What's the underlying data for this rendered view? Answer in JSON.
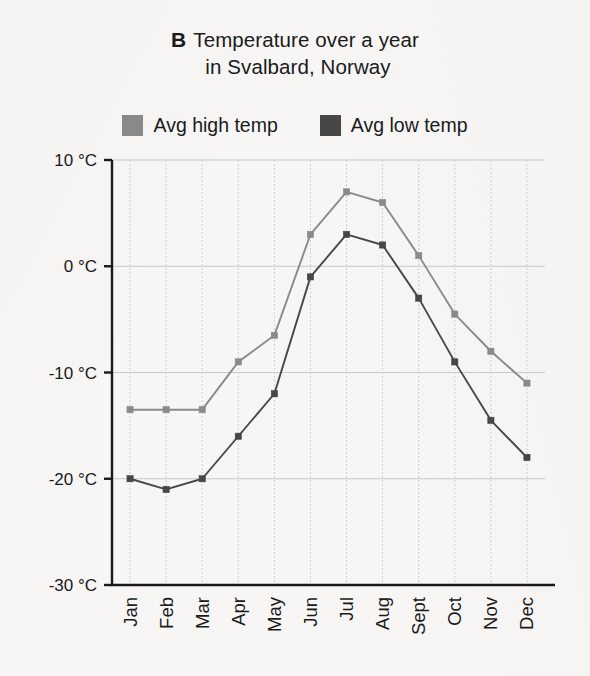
{
  "figure": {
    "panel_letter": "B",
    "title_line_1": "Temperature over a year",
    "title_line_2": "in Svalbard, Norway"
  },
  "legend": {
    "items": [
      {
        "label": "Avg high temp",
        "color": "#8a8a8a",
        "swatch_name": "legend-swatch-avg-high"
      },
      {
        "label": "Avg low temp",
        "color": "#474747",
        "swatch_name": "legend-swatch-avg-low"
      }
    ]
  },
  "axes": {
    "y_tick_labels": [
      "10 °C",
      "0 °C",
      "-10 °C",
      "-20 °C",
      "-30 °C"
    ],
    "y_tick_values": [
      10,
      0,
      -10,
      -20,
      -30
    ],
    "x_tick_labels": [
      "Jan",
      "Feb",
      "Mar",
      "Apr",
      "May",
      "Jun",
      "Jul",
      "Aug",
      "Sept",
      "Oct",
      "Nov",
      "Dec"
    ]
  },
  "chart_data": {
    "type": "line",
    "xlabel": "",
    "ylabel": "",
    "categories": [
      "Jan",
      "Feb",
      "Mar",
      "Apr",
      "May",
      "Jun",
      "Jul",
      "Aug",
      "Sept",
      "Oct",
      "Nov",
      "Dec"
    ],
    "series": [
      {
        "name": "Avg high temp",
        "color": "#8a8a8a",
        "values": [
          -13.5,
          -13.5,
          -13.5,
          -9,
          -6.5,
          3,
          7,
          6,
          1,
          -4.5,
          -8,
          -11
        ]
      },
      {
        "name": "Avg low temp",
        "color": "#474747",
        "values": [
          -20,
          -21,
          -20,
          -16,
          -12,
          -1,
          3,
          2,
          -3,
          -9,
          -14.5,
          -18
        ]
      }
    ],
    "ylim": [
      -30,
      10
    ],
    "y_ticks": [
      10,
      0,
      -10,
      -20,
      -30
    ],
    "y_unit": "°C",
    "grid": true,
    "legend_position": "top"
  }
}
